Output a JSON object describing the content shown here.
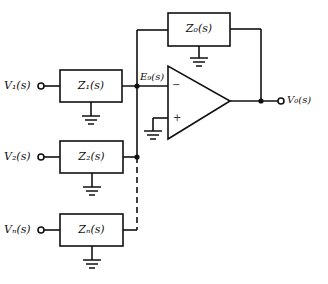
{
  "diagram": {
    "type": "op-amp summing circuit (block diagram)",
    "inputs": [
      {
        "label": "V₁(s)",
        "impedance": "Z₁(s)"
      },
      {
        "label": "V₂(s)",
        "impedance": "Z₂(s)"
      },
      {
        "label": "Vₙ(s)",
        "impedance": "Zₙ(s)"
      }
    ],
    "feedback": {
      "impedance": "Z₀(s)"
    },
    "summing_node": {
      "label": "E₉(s)"
    },
    "opamp": {
      "inverting": "−",
      "noninverting": "+"
    },
    "output": {
      "label": "V₀(s)"
    },
    "colors": {
      "stroke": "#111111",
      "background": "#ffffff"
    }
  }
}
